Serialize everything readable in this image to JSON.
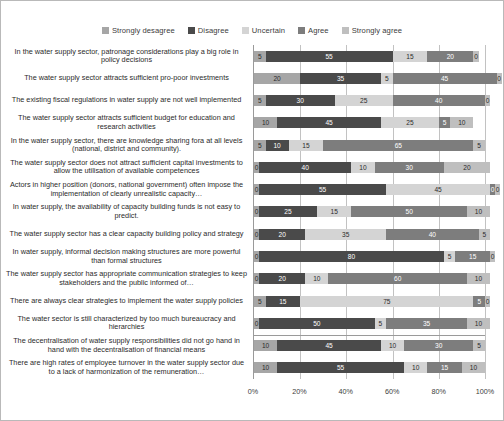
{
  "legend": {
    "position": "top",
    "items": [
      {
        "label": "Strongly desagree",
        "color": "#a6a6a6"
      },
      {
        "label": "Disagree",
        "color": "#4a4a4a"
      },
      {
        "label": "Uncertain",
        "color": "#d4d4d4"
      },
      {
        "label": "Agree",
        "color": "#7d7d7d"
      },
      {
        "label": "Strongly agree",
        "color": "#bfbfbf"
      }
    ]
  },
  "axis": {
    "ticks": [
      "0%",
      "20%",
      "40%",
      "60%",
      "80%",
      "100%"
    ],
    "tick_values": [
      0,
      20,
      40,
      60,
      80,
      100
    ]
  },
  "chart_data": {
    "type": "bar",
    "title": "",
    "subtitle": "",
    "xlabel": "",
    "ylabel": "",
    "orientation": "horizontal",
    "stacked": true,
    "normalized_percent": true,
    "xlim": [
      0,
      100
    ],
    "grid": "vertical",
    "legend_position": "top",
    "categories": [
      "In the water supply sector, patronage considerations play a big role in policy decisions",
      "The water supply sector attracts sufficient pro-poor investments",
      "The existing fiscal regulations in water supply are not well implemented",
      "The water supply sector attracts sufficient budget for education and research activities",
      "In the water supply sector, there are knowledge sharing fora at all levels (national, district and community).",
      "The water supply sector does not attract sufficient capital investments to allow the utilisation of available competences",
      "Actors in higher position (donors, national government) often impose the implementation of clearly unrealistic capacity…",
      "In water supply, the availability of capacity building funds is not easy to predict.",
      "The water supply sector has a clear capacity building policy and strategy",
      "In water supply, informal decision making structures are more powerful than formal structures",
      "The water supply sector has appropriate communication strategies to keep stakeholders and the public informed of…",
      "There are always clear strategies to implement the water supply policies",
      "The water sector is still characterized by too much bureaucracy and hierarchies",
      "The decentralisation of water supply responsibilities did not go hand in hand with the decentralisation of financial means",
      "There are high rates of employee turnover in the water supply sector due to a lack of harmonization of the remuneration…"
    ],
    "series": [
      {
        "name": "Strongly desagree",
        "color": "#a6a6a6",
        "values": [
          5,
          20,
          5,
          10,
          5,
          0,
          0,
          0,
          0,
          0,
          0,
          5,
          0,
          10,
          10
        ]
      },
      {
        "name": "Disagree",
        "color": "#4a4a4a",
        "values": [
          55,
          35,
          30,
          45,
          10,
          40,
          55,
          25,
          20,
          80,
          20,
          15,
          50,
          45,
          55
        ]
      },
      {
        "name": "Uncertain",
        "color": "#d4d4d4",
        "values": [
          15,
          5,
          25,
          25,
          15,
          10,
          45,
          15,
          35,
          5,
          10,
          75,
          5,
          10,
          10
        ]
      },
      {
        "name": "Agree",
        "color": "#7d7d7d",
        "values": [
          20,
          45,
          40,
          5,
          65,
          30,
          0,
          50,
          40,
          15,
          60,
          5,
          35,
          30,
          15
        ]
      },
      {
        "name": "Strongly agree",
        "color": "#bfbfbf",
        "values": [
          0,
          0,
          0,
          10,
          5,
          20,
          0,
          10,
          5,
          0,
          10,
          0,
          10,
          5,
          10
        ]
      }
    ]
  }
}
